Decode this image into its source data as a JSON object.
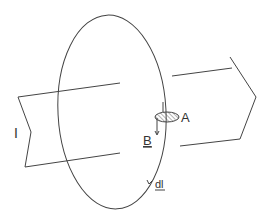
{
  "labels": {
    "current": "I",
    "area": "A",
    "field": "B",
    "line_element": "dl"
  },
  "colors": {
    "stroke": "#444444",
    "background": "#ffffff"
  }
}
